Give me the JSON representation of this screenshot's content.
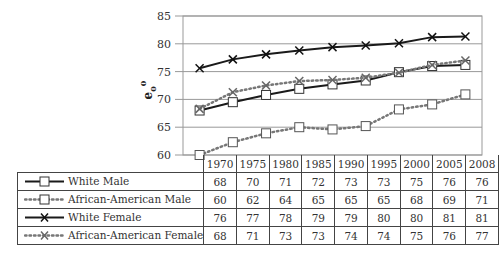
{
  "chart_data": {
    "type": "line",
    "title": "",
    "xlabel": "",
    "ylabel": "e0 0",
    "ylim": [
      60,
      85
    ],
    "yticks": [
      60,
      65,
      70,
      75,
      80,
      85
    ],
    "grid": true,
    "legend_position": "table-below",
    "categories": [
      "1970",
      "1975",
      "1980",
      "1985",
      "1990",
      "1995",
      "2000",
      "2005",
      "2008"
    ],
    "series": [
      {
        "name": "White Male",
        "marker": "square",
        "line": "solid",
        "values": [
          68,
          70,
          71,
          72,
          73,
          73,
          75,
          76,
          76
        ],
        "plotted": [
          68.0,
          69.5,
          70.8,
          71.9,
          72.7,
          73.4,
          74.9,
          76.0,
          76.2
        ]
      },
      {
        "name": "African-American Male",
        "marker": "square",
        "line": "dotted",
        "values": [
          60,
          62,
          64,
          65,
          65,
          65,
          68,
          69,
          71
        ],
        "plotted": [
          60.0,
          62.3,
          63.9,
          65.0,
          64.6,
          65.2,
          68.2,
          69.1,
          70.9
        ]
      },
      {
        "name": "White Female",
        "marker": "x",
        "line": "solid",
        "values": [
          76,
          77,
          78,
          79,
          79,
          80,
          80,
          81,
          81
        ],
        "plotted": [
          75.6,
          77.2,
          78.1,
          78.8,
          79.4,
          79.7,
          80.1,
          81.2,
          81.3
        ]
      },
      {
        "name": "African-American Female",
        "marker": "x",
        "line": "dotted",
        "values": [
          68,
          71,
          73,
          73,
          74,
          74,
          75,
          76,
          77
        ],
        "plotted": [
          68.3,
          71.3,
          72.5,
          73.3,
          73.5,
          73.9,
          74.8,
          76.2,
          77.0
        ]
      }
    ]
  },
  "colors": {
    "solid": "#1a1a1a",
    "dotted": "#777777",
    "grid": "#999999"
  }
}
